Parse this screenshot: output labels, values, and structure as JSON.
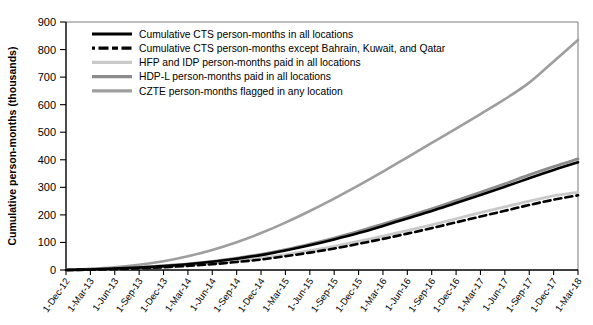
{
  "chart_data": {
    "type": "line",
    "title": "",
    "xlabel": "",
    "ylabel": "Cumulative person-months (thousands)",
    "ylim": [
      0,
      900
    ],
    "ytick_values": [
      0,
      100,
      200,
      300,
      400,
      500,
      600,
      700,
      800,
      900
    ],
    "grid": false,
    "legend_position": "top-left-inside",
    "x": [
      "1-Dec-12",
      "1-Mar-13",
      "1-Jun-13",
      "1-Sep-13",
      "1-Dec-13",
      "1-Mar-14",
      "1-Jun-14",
      "1-Sep-14",
      "1-Dec-14",
      "1-Mar-15",
      "1-Jun-15",
      "1-Sep-15",
      "1-Dec-15",
      "1-Mar-16",
      "1-Jun-16",
      "1-Sep-16",
      "1-Dec-16",
      "1-Mar-17",
      "1-Jun-17",
      "1-Sep-17",
      "1-Dec-17",
      "1-Mar-18"
    ],
    "series": [
      {
        "name": "Cumulative CTS person-months in all locations",
        "color": "#000000",
        "style": "solid",
        "width": 2.6,
        "values": [
          0,
          2,
          5,
          9,
          14,
          21,
          30,
          41,
          54,
          71,
          90,
          111,
          134,
          160,
          187,
          214,
          243,
          272,
          302,
          333,
          363,
          391
        ]
      },
      {
        "name": "Cumulative CTS person-months except Bahrain, Kuwait, and Qatar",
        "color": "#000000",
        "style": "dashed",
        "width": 2.6,
        "values": [
          0,
          1,
          3,
          6,
          10,
          15,
          21,
          29,
          38,
          50,
          63,
          78,
          95,
          113,
          132,
          152,
          173,
          194,
          215,
          236,
          255,
          271
        ]
      },
      {
        "name": "HFP and IDP person-months paid in all locations",
        "color": "#c9c9c9",
        "style": "solid",
        "width": 2.8,
        "values": [
          0,
          2,
          4,
          7,
          11,
          17,
          24,
          33,
          43,
          56,
          70,
          86,
          104,
          123,
          143,
          164,
          186,
          208,
          229,
          250,
          269,
          282
        ]
      },
      {
        "name": "HDP-L person-months paid in all locations",
        "color": "#8c8c8c",
        "style": "solid",
        "width": 2.8,
        "values": [
          0,
          2,
          5,
          9,
          15,
          22,
          31,
          43,
          57,
          74,
          94,
          116,
          140,
          167,
          194,
          222,
          252,
          282,
          313,
          345,
          375,
          403
        ]
      },
      {
        "name": "CZTE person-months flagged in any location",
        "color": "#9e9e9e",
        "style": "solid",
        "width": 2.6,
        "values": [
          0,
          4,
          10,
          19,
          32,
          50,
          73,
          101,
          134,
          172,
          214,
          259,
          307,
          357,
          409,
          461,
          513,
          566,
          620,
          680,
          757,
          835
        ]
      }
    ]
  },
  "legend": {
    "entries": [
      {
        "label": "Cumulative CTS person-months in all locations",
        "swatch": "solid-black"
      },
      {
        "label": "Cumulative CTS person-months except Bahrain, Kuwait, and Qatar",
        "swatch": "dashed-black"
      },
      {
        "label": "HFP and IDP person-months paid in all locations",
        "swatch": "solid-lightgray"
      },
      {
        "label": "HDP-L person-months paid in all locations",
        "swatch": "solid-midgray"
      },
      {
        "label": "CZTE person-months flagged in any location",
        "swatch": "solid-gray"
      }
    ]
  },
  "colors": {
    "cts": "#000000",
    "cts_except": "#000000",
    "hfp_idp": "#c9c9c9",
    "hdp_l": "#8c8c8c",
    "czte": "#9e9e9e",
    "axis": "#000000",
    "frame": "#7a7a7a",
    "background": "#ffffff"
  }
}
